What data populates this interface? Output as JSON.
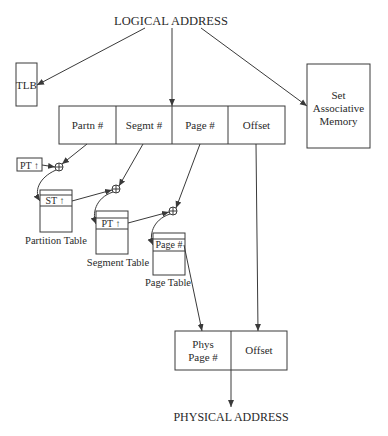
{
  "diagram": {
    "title": "LOGICAL ADDRESS",
    "footer": "PHYSICAL ADDRESS",
    "tlb": {
      "label": "TLB"
    },
    "set_associative_memory": {
      "line1": "Set",
      "line2": "Associative",
      "line3": "Memory"
    },
    "logical_address_fields": [
      {
        "label": "Partn #"
      },
      {
        "label": "Segmt #"
      },
      {
        "label": "Page #"
      },
      {
        "label": "Offset"
      }
    ],
    "pt_pointer": {
      "label": "PT ↑"
    },
    "partition_table": {
      "entry": "ST ↑",
      "caption": "Partition Table"
    },
    "segment_table": {
      "entry": "PT ↑",
      "caption": "Segment Table"
    },
    "page_table": {
      "entry": "Page #",
      "caption": "Page Table"
    },
    "physical_address_fields": [
      {
        "line1": "Phys",
        "line2": "Page #"
      },
      {
        "label": "Offset"
      }
    ],
    "adder_symbol": "+"
  }
}
